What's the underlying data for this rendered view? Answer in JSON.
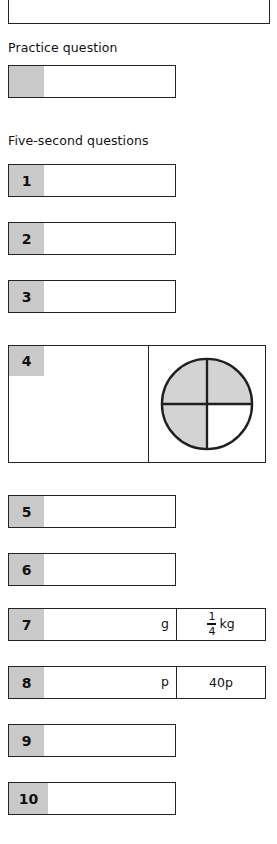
{
  "page": {
    "background_color": "#ffffff",
    "ink_color": "#1a1a1a",
    "cell_fill_color": "#c9c9c9",
    "border_color": "#242424"
  },
  "headings": {
    "practice": "Practice question",
    "five_second": "Five-second questions"
  },
  "practice_row": {
    "number": "",
    "answer": ""
  },
  "questions": [
    {
      "number": "1",
      "answer": "",
      "unit": "",
      "given": ""
    },
    {
      "number": "2",
      "answer": "",
      "unit": "",
      "given": ""
    },
    {
      "number": "3",
      "answer": "",
      "unit": "",
      "given": ""
    },
    {
      "number": "4",
      "answer": "",
      "unit": "",
      "given": ""
    },
    {
      "number": "5",
      "answer": "",
      "unit": "",
      "given": ""
    },
    {
      "number": "6",
      "answer": "",
      "unit": "",
      "given": ""
    },
    {
      "number": "7",
      "answer": "",
      "unit": "g",
      "given": ""
    },
    {
      "number": "8",
      "answer": "",
      "unit": "p",
      "given": "40p"
    },
    {
      "number": "9",
      "answer": "",
      "unit": "",
      "given": ""
    },
    {
      "number": "10",
      "answer": "",
      "unit": "",
      "given": ""
    }
  ],
  "question7_given": {
    "numerator": "1",
    "denominator": "4",
    "unit": "kg"
  },
  "question4_figure": {
    "shape": "circle",
    "divisions": 4,
    "shaded_count": 3,
    "shaded_quadrants": [
      "top-left",
      "top-right",
      "bottom-left"
    ],
    "unshaded_quadrants": [
      "bottom-right"
    ],
    "fill_color": "#d3d3d3",
    "stroke_color": "#1f1f1f"
  }
}
